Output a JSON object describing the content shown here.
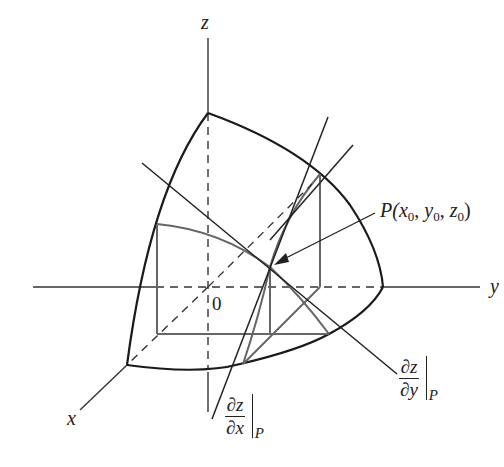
{
  "figure": {
    "axes": {
      "x_label": "x",
      "y_label": "y",
      "z_label": "z",
      "origin_label": "0"
    },
    "point": {
      "name": "P",
      "label": "P(x0, y0, z0)",
      "prefix": "P(",
      "x": "x",
      "x_sub": "0",
      "y": "y",
      "y_sub": "0",
      "z": "z",
      "z_sub": "0",
      "sep": ", ",
      "suffix": ")"
    },
    "tangent_x": {
      "numerator": "∂z",
      "denominator": "∂x",
      "eval_at": "P"
    },
    "tangent_y": {
      "numerator": "∂z",
      "denominator": "∂y",
      "eval_at": "P"
    },
    "colors": {
      "ink": "#222222",
      "gray_ink": "#6a6a6a",
      "background": "#ffffff"
    }
  }
}
